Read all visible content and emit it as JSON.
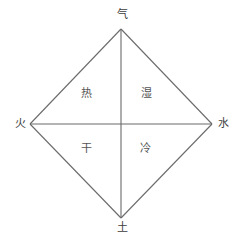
{
  "diagram": {
    "background_color": "#ffffff",
    "line_color": "#6b6b6b",
    "label_color": "#4a4a4a",
    "geometry": {
      "top_vertex": "121,29",
      "left_vertex": "30,124",
      "right_vertex": "212,124",
      "bottom_vertex": "121,218",
      "center": "121,124"
    },
    "vertices": [
      {
        "id": "air",
        "label": "气",
        "position": "top"
      },
      {
        "id": "fire",
        "label": "火",
        "position": "left"
      },
      {
        "id": "water",
        "label": "水",
        "position": "right"
      },
      {
        "id": "earth",
        "label": "土",
        "position": "bottom"
      }
    ],
    "quadrants": [
      {
        "id": "hot",
        "label": "热",
        "position": "upper-left"
      },
      {
        "id": "moist",
        "label": "湿",
        "position": "upper-right"
      },
      {
        "id": "dry",
        "label": "干",
        "position": "lower-left"
      },
      {
        "id": "cold",
        "label": "冷",
        "position": "lower-right"
      }
    ]
  }
}
